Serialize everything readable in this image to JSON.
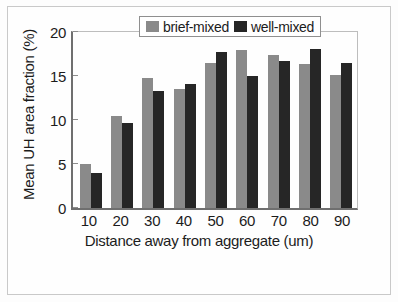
{
  "chart_data": {
    "type": "bar",
    "title": "",
    "xlabel": "Distance away from aggregate (um)",
    "ylabel": "Mean UH area fraction (%)",
    "categories": [
      "10",
      "20",
      "30",
      "40",
      "50",
      "60",
      "70",
      "80",
      "90"
    ],
    "series": [
      {
        "name": "brief-mixed",
        "color": "#8a8a8a",
        "values": [
          5.0,
          10.4,
          14.8,
          13.5,
          16.5,
          18.0,
          17.4,
          16.4,
          15.1
        ]
      },
      {
        "name": "well-mixed",
        "color": "#262626",
        "values": [
          4.0,
          9.7,
          13.3,
          14.1,
          17.7,
          15.0,
          16.7,
          18.1,
          16.5
        ]
      }
    ],
    "ylim": [
      0,
      20
    ],
    "yticks": [
      "0",
      "5",
      "10",
      "15",
      "20"
    ],
    "ytick_values": [
      0,
      5,
      10,
      15,
      20
    ],
    "grid": false,
    "legend_position": "top-center"
  },
  "legend": {
    "entries": [
      {
        "label": "brief-mixed",
        "swatch": "brief-mixed-swatch"
      },
      {
        "label": "well-mixed",
        "swatch": "well-mixed-swatch"
      }
    ]
  }
}
